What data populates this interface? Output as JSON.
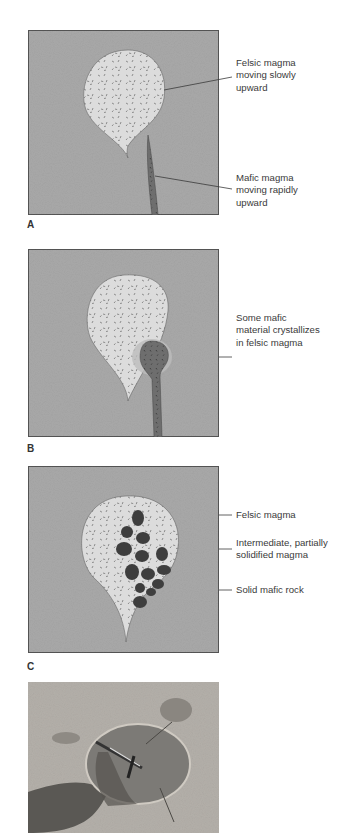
{
  "colors": {
    "host_rock": "#a9a9a9",
    "felsic_magma": "#dcdcdc",
    "mafic_magma": "#6e6e6e",
    "mafic_rock": "#3e3e3e",
    "leader_line": "#3a3a3a"
  },
  "panels": [
    {
      "label": "A",
      "callouts": [
        {
          "text": "Felsic magma moving slowly upward",
          "lines": [
            "Felsic magma",
            "moving slowly",
            "upward"
          ]
        },
        {
          "text": "Mafic magma moving rapidly upward",
          "lines": [
            "Mafic magma",
            "moving rapidly",
            "upward"
          ]
        }
      ]
    },
    {
      "label": "B",
      "callouts": [
        {
          "text": "Some mafic material crystallizes in felsic magma",
          "lines": [
            "Some mafic",
            "material crystallizes",
            "in felsic magma"
          ]
        }
      ]
    },
    {
      "label": "C",
      "callouts": [
        {
          "text": "Felsic magma",
          "lines": [
            "Felsic magma"
          ]
        },
        {
          "text": "Intermediate, partially solidified magma",
          "lines": [
            "Intermediate, partially",
            "solidified magma"
          ]
        },
        {
          "text": "Solid mafic rock",
          "lines": [
            "Solid mafic rock"
          ]
        }
      ]
    },
    {
      "label": "",
      "type": "photograph",
      "description": "Outcrop photo of a dark mafic enclave in lighter felsic rock with a rock hammer for scale"
    }
  ]
}
